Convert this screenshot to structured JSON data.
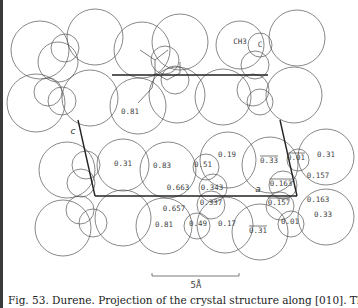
{
  "figure": {
    "caption": "Fig. 53. Durene. Projection of the crystal structure along [010]. The fractional",
    "scale_bar_label": "5Å",
    "axis_labels": {
      "c": "c",
      "a": "a"
    },
    "group_labels": {
      "methyl": "CH3",
      "carbon": "C"
    },
    "atom_heights": [
      {
        "id": "h1",
        "text": "0.81",
        "x": 130,
        "y": 114,
        "overline": false
      },
      {
        "id": "h2",
        "text": "0.31",
        "x": 123,
        "y": 166,
        "overline": false
      },
      {
        "id": "h3",
        "text": "0.83",
        "x": 162,
        "y": 168,
        "overline": false
      },
      {
        "id": "h4",
        "text": "0.51",
        "x": 203,
        "y": 167,
        "overline": false
      },
      {
        "id": "h5",
        "text": "0.19",
        "x": 227,
        "y": 157,
        "overline": false
      },
      {
        "id": "h6",
        "text": "0.663",
        "x": 178,
        "y": 190,
        "overline": false
      },
      {
        "id": "h7",
        "text": "0.343",
        "x": 212,
        "y": 190,
        "overline": false
      },
      {
        "id": "h8",
        "text": "0.33",
        "x": 269,
        "y": 163,
        "overline": true
      },
      {
        "id": "h9",
        "text": "0.01",
        "x": 296,
        "y": 160,
        "overline": true
      },
      {
        "id": "h10",
        "text": "0.31",
        "x": 326,
        "y": 157,
        "overline": false
      },
      {
        "id": "h11",
        "text": "0.157",
        "x": 318,
        "y": 178,
        "overline": false
      },
      {
        "id": "h12",
        "text": "0.163",
        "x": 281,
        "y": 186,
        "overline": true
      },
      {
        "id": "h13",
        "text": "0.337",
        "x": 211,
        "y": 205,
        "overline": false
      },
      {
        "id": "h14",
        "text": "0.657",
        "x": 174,
        "y": 211,
        "overline": false
      },
      {
        "id": "h15",
        "text": "0.157",
        "x": 279,
        "y": 205,
        "overline": true
      },
      {
        "id": "h16",
        "text": "0.163",
        "x": 318,
        "y": 202,
        "overline": false
      },
      {
        "id": "h17",
        "text": "0.81",
        "x": 164,
        "y": 227,
        "overline": false
      },
      {
        "id": "h18",
        "text": "0.49",
        "x": 198,
        "y": 226,
        "overline": false
      },
      {
        "id": "h19",
        "text": "0.17",
        "x": 227,
        "y": 226,
        "overline": false
      },
      {
        "id": "h20",
        "text": "0.01",
        "x": 290,
        "y": 224,
        "overline": false
      },
      {
        "id": "h21",
        "text": "0.33",
        "x": 323,
        "y": 217,
        "overline": false
      },
      {
        "id": "h22",
        "text": "0.31",
        "x": 258,
        "y": 233,
        "overline": true
      }
    ]
  }
}
